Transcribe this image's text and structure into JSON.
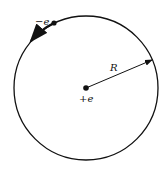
{
  "diagram": {
    "type": "bohr-atom-orbit",
    "electron_label": "−e",
    "nucleus_label": "+e",
    "radius_label": "R",
    "colors": {
      "stroke": "#111111",
      "background": "#ffffff"
    },
    "geometry": {
      "center": [
        86,
        88
      ],
      "radius": 72,
      "electron": [
        54,
        23
      ],
      "radius_arrow_tip": [
        152,
        60
      ]
    }
  }
}
